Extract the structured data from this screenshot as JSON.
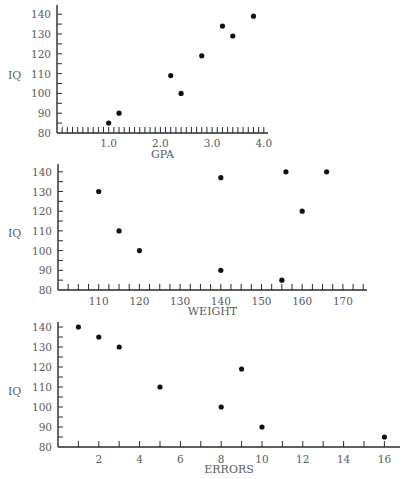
{
  "chart_data": [
    {
      "type": "scatter",
      "title": "",
      "xlabel": "GPA",
      "ylabel": "IQ",
      "xlim": [
        0,
        4.1
      ],
      "ylim": [
        80,
        145
      ],
      "xticks": [
        1.0,
        2.0,
        3.0,
        4.0
      ],
      "xtick_labels": [
        "1.0",
        "2.0",
        "3.0",
        "4.0"
      ],
      "xminor_step": 0.1,
      "yticks": [
        80,
        90,
        100,
        110,
        120,
        130,
        140
      ],
      "ytick_labels": [
        "80",
        "90",
        "100",
        "110",
        "120",
        "130",
        "140"
      ],
      "yminor_step": 5,
      "grid": false,
      "legend": null,
      "points": [
        {
          "x": 1.0,
          "y": 85
        },
        {
          "x": 1.2,
          "y": 90
        },
        {
          "x": 2.2,
          "y": 109
        },
        {
          "x": 2.4,
          "y": 100
        },
        {
          "x": 2.8,
          "y": 119
        },
        {
          "x": 3.2,
          "y": 134
        },
        {
          "x": 3.4,
          "y": 129
        },
        {
          "x": 3.8,
          "y": 139
        }
      ],
      "layout": {
        "x0": 57,
        "x_end": 268,
        "px_per_x": 51.7,
        "y_base": 133,
        "px_per_y": 1.98,
        "y_top": 5,
        "label_y": 143,
        "title_y": 158
      }
    },
    {
      "type": "scatter",
      "title": "",
      "xlabel": "WEIGHT",
      "ylabel": "IQ",
      "xlim": [
        100,
        176
      ],
      "ylim": [
        80,
        144
      ],
      "xticks": [
        110,
        120,
        130,
        140,
        150,
        160,
        170
      ],
      "xtick_labels": [
        "110",
        "120",
        "130",
        "140",
        "150",
        "160",
        "170"
      ],
      "xminor_step": 2.5,
      "yticks": [
        80,
        90,
        100,
        110,
        120,
        130,
        140
      ],
      "ytick_labels": [
        "80",
        "90",
        "100",
        "110",
        "120",
        "130",
        "140"
      ],
      "yminor_step": 5,
      "grid": false,
      "legend": null,
      "points": [
        {
          "x": 110,
          "y": 130
        },
        {
          "x": 115,
          "y": 110
        },
        {
          "x": 120,
          "y": 100
        },
        {
          "x": 140,
          "y": 137
        },
        {
          "x": 140,
          "y": 90
        },
        {
          "x": 155,
          "y": 85
        },
        {
          "x": 156,
          "y": 140
        },
        {
          "x": 160,
          "y": 120
        },
        {
          "x": 166,
          "y": 140
        }
      ],
      "layout": {
        "x0": 58,
        "x_origin_value": 100,
        "x_end": 367,
        "px_per_x": 4.07,
        "y_base": 290,
        "px_per_y": 1.97,
        "y_top": 164,
        "label_y": 301,
        "title_y": 315
      }
    },
    {
      "type": "scatter",
      "title": "",
      "xlabel": "ERRORS",
      "ylabel": "IQ",
      "xlim": [
        0,
        16.8
      ],
      "ylim": [
        80,
        142
      ],
      "xticks": [
        2,
        4,
        6,
        8,
        10,
        12,
        14,
        16
      ],
      "xtick_labels": [
        "2",
        "4",
        "6",
        "8",
        "10",
        "12",
        "14",
        "16"
      ],
      "xminor_step": 1,
      "yticks": [
        80,
        90,
        100,
        110,
        120,
        130,
        140
      ],
      "ytick_labels": [
        "80",
        "90",
        "100",
        "110",
        "120",
        "130",
        "140"
      ],
      "yminor_step": 5,
      "grid": false,
      "legend": null,
      "points": [
        {
          "x": 1,
          "y": 140
        },
        {
          "x": 2,
          "y": 135
        },
        {
          "x": 3,
          "y": 130
        },
        {
          "x": 5,
          "y": 110
        },
        {
          "x": 8,
          "y": 100
        },
        {
          "x": 9,
          "y": 119
        },
        {
          "x": 10,
          "y": 90
        },
        {
          "x": 16,
          "y": 85
        }
      ],
      "layout": {
        "x0": 58,
        "x_end": 400,
        "px_per_x": 20.4,
        "y_base": 447,
        "px_per_y": 2.0,
        "y_top": 322,
        "label_y": 459,
        "title_y": 473
      }
    }
  ]
}
